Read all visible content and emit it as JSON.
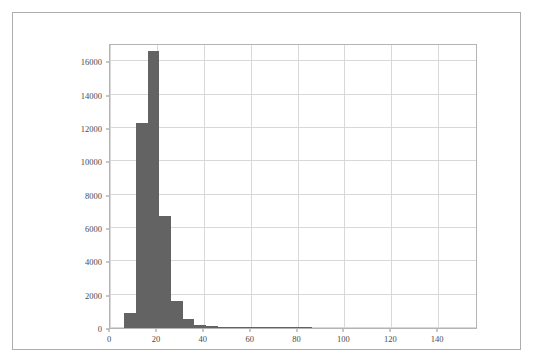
{
  "figure": {
    "background_color": "#ffffff",
    "frame_color": "#adadad",
    "title": ""
  },
  "chart_data": {
    "type": "bar",
    "subtype": "histogram",
    "title": "",
    "xlabel": "",
    "ylabel": "",
    "xlim": [
      0,
      157
    ],
    "ylim": [
      0,
      17100
    ],
    "grid": true,
    "legend": null,
    "bar_color": "#636363",
    "gridline_color": "#d8d8d8",
    "bin_width": 5,
    "bin_edges": [
      6,
      11,
      16,
      21,
      26,
      31,
      36,
      41,
      46,
      51,
      56,
      61,
      66,
      71,
      76,
      81,
      86
    ],
    "x_tick_labels": [
      "0",
      "20",
      "40",
      "60",
      "80",
      "100",
      "120",
      "140"
    ],
    "x_tick_values": [
      0,
      20,
      40,
      60,
      80,
      100,
      120,
      140
    ],
    "y_tick_labels": [
      "0",
      "2000",
      "4000",
      "6000",
      "8000",
      "10000",
      "12000",
      "14000",
      "16000"
    ],
    "y_tick_values": [
      0,
      2000,
      4000,
      6000,
      8000,
      10000,
      12000,
      14000,
      16000
    ],
    "bars": [
      {
        "x0": 6,
        "x1": 11,
        "value": 900
      },
      {
        "x0": 11,
        "x1": 16,
        "value": 12300
      },
      {
        "x0": 16,
        "x1": 21,
        "value": 16600
      },
      {
        "x0": 21,
        "x1": 26,
        "value": 6700
      },
      {
        "x0": 26,
        "x1": 31,
        "value": 1600
      },
      {
        "x0": 31,
        "x1": 36,
        "value": 560
      },
      {
        "x0": 36,
        "x1": 41,
        "value": 160
      },
      {
        "x0": 41,
        "x1": 46,
        "value": 110
      },
      {
        "x0": 46,
        "x1": 51,
        "value": 45
      },
      {
        "x0": 51,
        "x1": 56,
        "value": 30
      },
      {
        "x0": 56,
        "x1": 61,
        "value": 22
      },
      {
        "x0": 61,
        "x1": 66,
        "value": 16
      },
      {
        "x0": 66,
        "x1": 71,
        "value": 12
      },
      {
        "x0": 71,
        "x1": 76,
        "value": 9
      },
      {
        "x0": 76,
        "x1": 81,
        "value": 6
      },
      {
        "x0": 81,
        "x1": 86,
        "value": 4
      }
    ]
  }
}
